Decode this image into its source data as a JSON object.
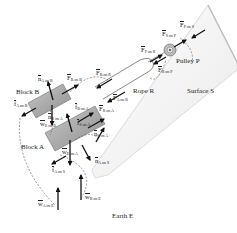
{
  "objects": {
    "block_a": "Block A",
    "block_b": "Block B",
    "rope": "Rope R",
    "pulley": "Pulley P",
    "surface": "Surface S",
    "earth": "Earth E"
  },
  "forces": [
    {
      "id": "n_A_on_B",
      "sym": "n",
      "sub": "A on B"
    },
    {
      "id": "F_R_on_B",
      "sym": "F",
      "sub": "R on B"
    },
    {
      "id": "F_B_on_R",
      "sym": "F",
      "sub": "B on R"
    },
    {
      "id": "f_A_on_B",
      "sym": "f",
      "sub": "A on B"
    },
    {
      "id": "w_E_on_B",
      "sym": "w",
      "sub": "E on B"
    },
    {
      "id": "n_B_on_A",
      "sym": "n",
      "sub": "B on A"
    },
    {
      "id": "f_B_on_A",
      "sym": "f",
      "sub": "B on A"
    },
    {
      "id": "F_R_on_A",
      "sym": "F",
      "sub": "R on A"
    },
    {
      "id": "F_A_on_R",
      "sym": "F",
      "sub": "A on R"
    },
    {
      "id": "n_S_on_A",
      "sym": "n",
      "sub": "S on A"
    },
    {
      "id": "f_S_on_A",
      "sym": "f",
      "sub": "S on A"
    },
    {
      "id": "w_E_on_A",
      "sym": "w",
      "sub": "E on A"
    },
    {
      "id": "n_A_on_S",
      "sym": "n",
      "sub": "A on S"
    },
    {
      "id": "f_A_on_S",
      "sym": "f",
      "sub": "A on S"
    },
    {
      "id": "w_A_on_E",
      "sym": "w",
      "sub": "A on E"
    },
    {
      "id": "w_B_on_E",
      "sym": "w",
      "sub": "B on E"
    },
    {
      "id": "F_P_on_R",
      "sym": "F",
      "sub": "P on R"
    },
    {
      "id": "F_R_on_P",
      "sym": "F",
      "sub": "R on P"
    },
    {
      "id": "F_S_on_P",
      "sym": "F",
      "sub": "S on P"
    },
    {
      "id": "F_P_on_S",
      "sym": "F",
      "sub": "P on S"
    }
  ],
  "colors": {
    "surface_fill": "#f4f4f4",
    "surface_edge": "#cfcfcf",
    "block_fill": "#a9a9a9",
    "block_edge": "#6e6e6e",
    "arrow": "#111111",
    "dashed": "#555555"
  }
}
